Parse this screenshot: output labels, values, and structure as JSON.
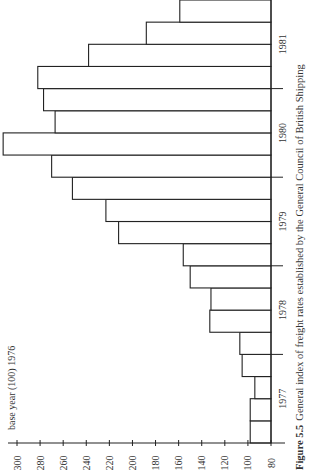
{
  "chart_data": {
    "type": "bar",
    "orientation": "rotated-90-ccw",
    "caption_prefix": "Figure 5.5",
    "caption_text": "General index of freight rates established by the General Council of British Shipping",
    "annotation": "base year (100) 1976",
    "xlabel": "",
    "ylabel": "",
    "year_labels": [
      "1977",
      "1978",
      "1979",
      "1980",
      "1981"
    ],
    "categories": [
      "1977 Q1",
      "1977 Q2",
      "1977 Q3",
      "1977 Q4",
      "1978 Q1",
      "1978 Q2",
      "1978 Q3",
      "1978 Q4",
      "1979 Q1",
      "1979 Q2",
      "1979 Q3",
      "1979 Q4",
      "1980 Q1",
      "1980 Q2",
      "1980 Q3",
      "1980 Q4",
      "1981 Q1",
      "1981 Q2",
      "1981 Q3",
      "1981 Q4"
    ],
    "values": [
      98,
      98,
      94,
      105,
      107,
      133,
      132,
      150,
      156,
      212,
      223,
      252,
      270,
      312,
      267,
      277,
      282,
      238,
      188,
      159
    ],
    "yticks": [
      80,
      100,
      120,
      140,
      160,
      180,
      200,
      220,
      240,
      260,
      280,
      300
    ],
    "ylim": [
      80,
      310
    ],
    "grid": false,
    "legend": null
  }
}
